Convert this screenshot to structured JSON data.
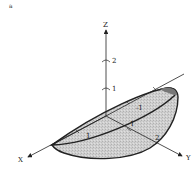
{
  "figure": {
    "panel_label": "a",
    "axes": {
      "z": {
        "label": "Z",
        "ticks": [
          "1",
          "2"
        ]
      },
      "x": {
        "label": "X"
      },
      "y": {
        "label": "Y"
      }
    },
    "surface_labels": {
      "tick_x_1": "1",
      "tick_neg1": "-1",
      "tick_center_1": "1",
      "tick_y_2": "2"
    },
    "colors": {
      "ink": "#222222",
      "surface_fill": "#c9c9c9",
      "surface_inner": "#a8a8a8",
      "background": "#ffffff"
    }
  }
}
